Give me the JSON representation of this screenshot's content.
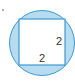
{
  "diagram": {
    "colors": {
      "circle_fill": "#b8dcef",
      "circle_stroke": "#3a9ad4",
      "square_fill": "#ffffff",
      "square_stroke": "#3a9ad4",
      "label": "#333333"
    },
    "labels": {
      "right_side": "2",
      "bottom_side": "2"
    }
  }
}
